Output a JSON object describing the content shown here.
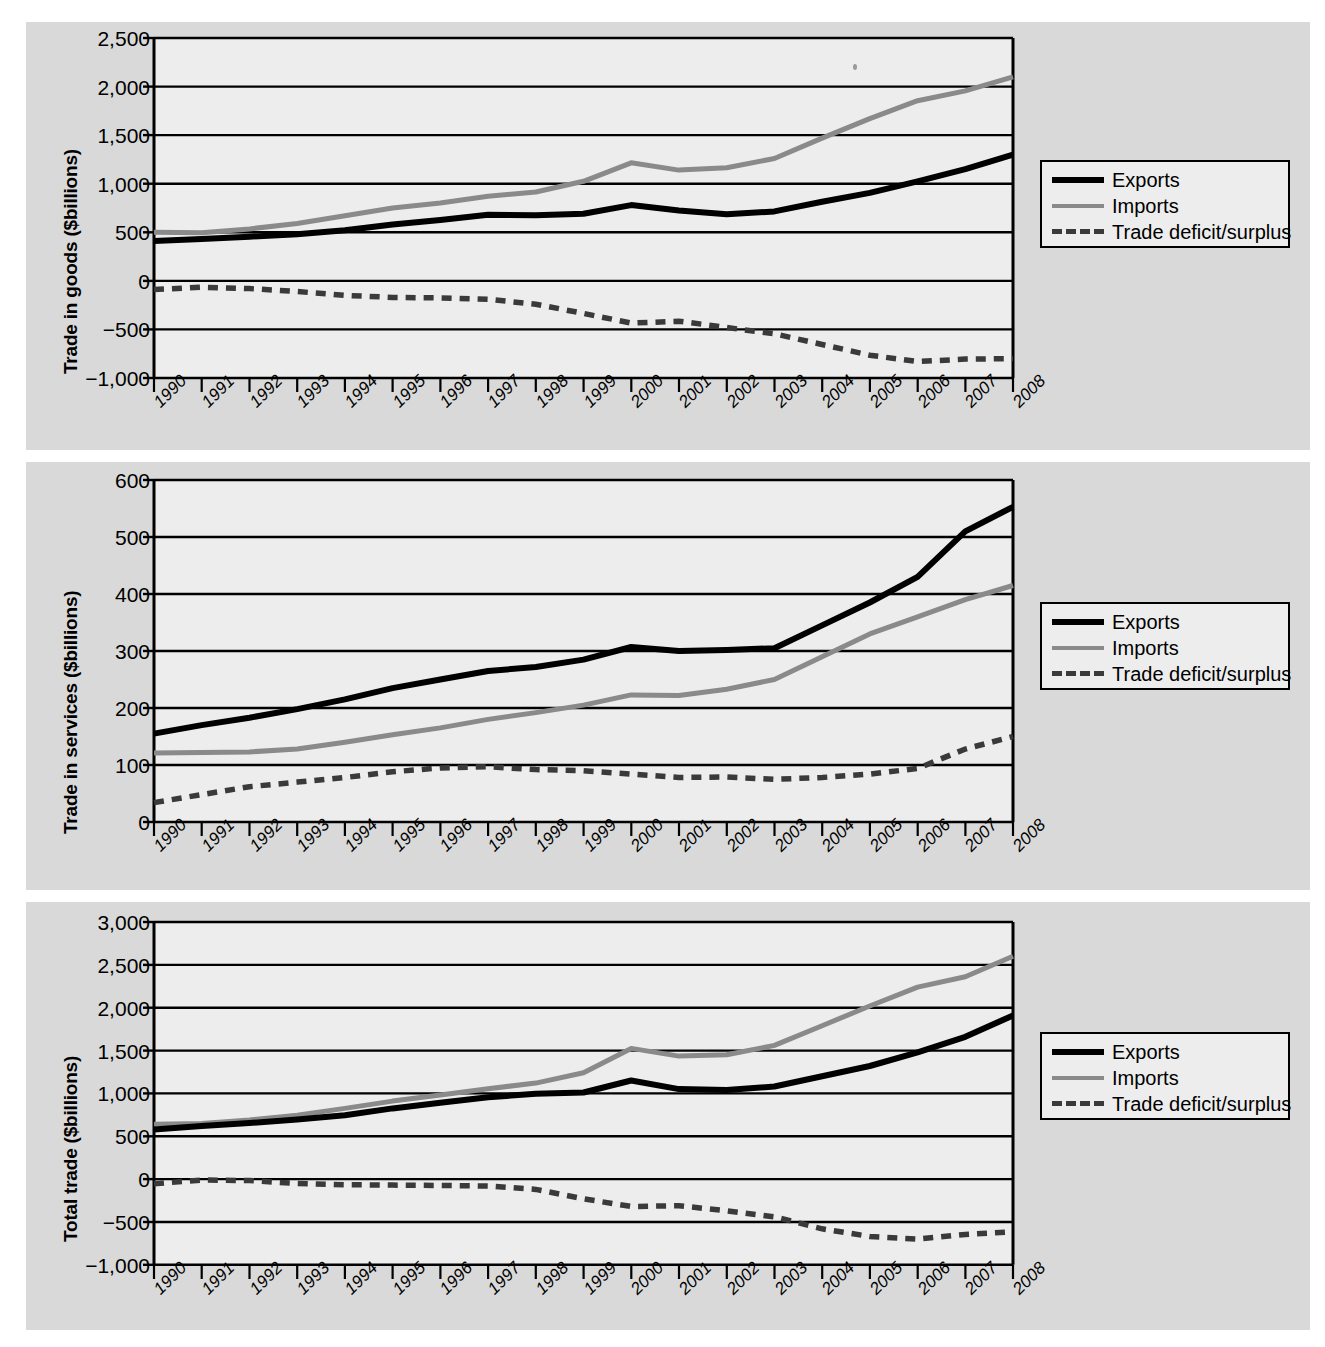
{
  "figure": {
    "background": "#ffffff",
    "panel_bg": "#d9d9d9",
    "plot_bg": "#ededed",
    "colors": {
      "exports": "#000000",
      "imports": "#8a8a8a",
      "deficit": "#3a3a3a",
      "grid": "#000000",
      "axis": "#000000"
    }
  },
  "legend": {
    "exports_label": "Exports",
    "imports_label": "Imports",
    "deficit_label": "Trade deficit/surplus"
  },
  "chart_data": [
    {
      "id": "goods",
      "type": "line",
      "title": "",
      "xlabel": "",
      "ylabel": "Trade in goods ($billions)",
      "x": [
        1990,
        1991,
        1992,
        1993,
        1994,
        1995,
        1996,
        1997,
        1998,
        1999,
        2000,
        2001,
        2002,
        2003,
        2004,
        2005,
        2006,
        2007,
        2008
      ],
      "categories": [
        "1990",
        "1991",
        "1992",
        "1993",
        "1994",
        "1995",
        "1996",
        "1997",
        "1998",
        "1999",
        "2000",
        "2001",
        "2002",
        "2003",
        "2004",
        "2005",
        "2006",
        "2007",
        "2008"
      ],
      "yticks": [
        -1000,
        -500,
        0,
        500,
        1000,
        1500,
        2000,
        2500
      ],
      "ytick_labels": [
        "−1,000",
        "−500",
        "0",
        "500",
        "1,000",
        "1,500",
        "2,000",
        "2,500"
      ],
      "ylim": [
        -1000,
        2500
      ],
      "grid": true,
      "legend_position": "right",
      "series": [
        {
          "name": "Exports",
          "values": [
            410,
            430,
            455,
            480,
            520,
            580,
            625,
            680,
            675,
            690,
            780,
            725,
            685,
            715,
            815,
            905,
            1025,
            1150,
            1300
          ]
        },
        {
          "name": "Imports",
          "values": [
            500,
            495,
            535,
            590,
            670,
            750,
            800,
            870,
            915,
            1025,
            1215,
            1140,
            1165,
            1260,
            1470,
            1670,
            1855,
            1955,
            2100
          ]
        },
        {
          "name": "Trade deficit/surplus",
          "values": [
            -90,
            -65,
            -80,
            -110,
            -150,
            -170,
            -175,
            -190,
            -240,
            -335,
            -435,
            -415,
            -480,
            -545,
            -655,
            -765,
            -830,
            -805,
            -800
          ]
        }
      ]
    },
    {
      "id": "services",
      "type": "line",
      "title": "",
      "xlabel": "",
      "ylabel": "Trade in services ($billions)",
      "x": [
        1990,
        1991,
        1992,
        1993,
        1994,
        1995,
        1996,
        1997,
        1998,
        1999,
        2000,
        2001,
        2002,
        2003,
        2004,
        2005,
        2006,
        2007,
        2008
      ],
      "categories": [
        "1990",
        "1991",
        "1992",
        "1993",
        "1994",
        "1995",
        "1996",
        "1997",
        "1998",
        "1999",
        "2000",
        "2001",
        "2002",
        "2003",
        "2004",
        "2005",
        "2006",
        "2007",
        "2008"
      ],
      "yticks": [
        0,
        100,
        200,
        300,
        400,
        500,
        600
      ],
      "ytick_labels": [
        "0",
        "100",
        "200",
        "300",
        "400",
        "500",
        "600"
      ],
      "ylim": [
        0,
        600
      ],
      "grid": true,
      "legend_position": "right",
      "series": [
        {
          "name": "Exports",
          "values": [
            155,
            170,
            183,
            198,
            215,
            235,
            250,
            265,
            272,
            285,
            307,
            300,
            302,
            305,
            345,
            385,
            430,
            510,
            553
          ]
        },
        {
          "name": "Imports",
          "values": [
            121,
            122,
            123,
            128,
            140,
            153,
            165,
            180,
            192,
            205,
            223,
            222,
            233,
            250,
            290,
            330,
            360,
            390,
            415
          ]
        },
        {
          "name": "Trade deficit/surplus",
          "values": [
            34,
            48,
            62,
            70,
            78,
            88,
            95,
            97,
            92,
            90,
            84,
            78,
            79,
            75,
            78,
            84,
            94,
            128,
            150
          ]
        }
      ]
    },
    {
      "id": "total",
      "type": "line",
      "title": "",
      "xlabel": "",
      "ylabel": "Total trade ($billions)",
      "x": [
        1990,
        1991,
        1992,
        1993,
        1994,
        1995,
        1996,
        1997,
        1998,
        1999,
        2000,
        2001,
        2002,
        2003,
        2004,
        2005,
        2006,
        2007,
        2008
      ],
      "categories": [
        "1990",
        "1991",
        "1992",
        "1993",
        "1994",
        "1995",
        "1996",
        "1997",
        "1998",
        "1999",
        "2000",
        "2001",
        "2002",
        "2003",
        "2004",
        "2005",
        "2006",
        "2007",
        "2008"
      ],
      "yticks": [
        -1000,
        -500,
        0,
        500,
        1000,
        1500,
        2000,
        2500,
        3000
      ],
      "ytick_labels": [
        "−1,000",
        "−500",
        "0",
        "500",
        "1,000",
        "1,500",
        "2,000",
        "2,500",
        "3,000"
      ],
      "ylim": [
        -1000,
        3000
      ],
      "grid": true,
      "legend_position": "right",
      "series": [
        {
          "name": "Exports",
          "values": [
            580,
            618,
            655,
            695,
            745,
            825,
            890,
            955,
            995,
            1010,
            1150,
            1050,
            1040,
            1080,
            1200,
            1320,
            1480,
            1660,
            1910
          ]
        },
        {
          "name": "Imports",
          "values": [
            640,
            650,
            690,
            745,
            825,
            910,
            980,
            1055,
            1120,
            1240,
            1525,
            1435,
            1450,
            1560,
            1790,
            2020,
            2240,
            2360,
            2600
          ]
        },
        {
          "name": "Trade deficit/surplus",
          "values": [
            -55,
            -10,
            -18,
            -50,
            -65,
            -70,
            -75,
            -80,
            -120,
            -230,
            -320,
            -310,
            -370,
            -440,
            -580,
            -670,
            -700,
            -645,
            -615
          ]
        }
      ]
    }
  ]
}
